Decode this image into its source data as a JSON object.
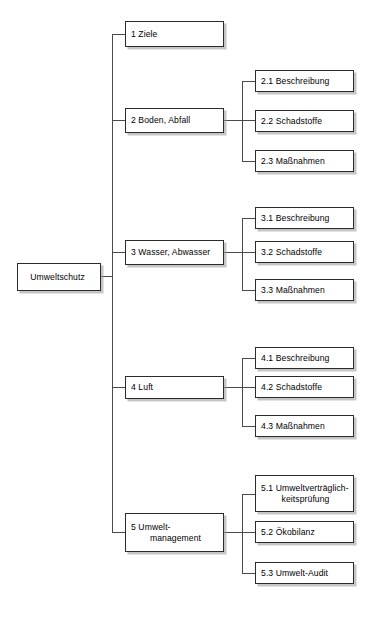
{
  "diagram": {
    "title": "Umweltschutz",
    "type": "organizational-tree",
    "root": {
      "label": "Umweltschutz"
    },
    "branches": [
      {
        "id": "1",
        "label": "1 Ziele",
        "children": []
      },
      {
        "id": "2",
        "label": "2 Boden, Abfall",
        "children": [
          {
            "id": "2.1",
            "label": "2.1 Beschreibung"
          },
          {
            "id": "2.2",
            "label": "2.2 Schadstoffe"
          },
          {
            "id": "2.3",
            "label": "2.3 Maßnahmen"
          }
        ]
      },
      {
        "id": "3",
        "label": "3 Wasser, Abwasser",
        "children": [
          {
            "id": "3.1",
            "label": "3.1 Beschreibung"
          },
          {
            "id": "3.2",
            "label": "3.2 Schadstoffe"
          },
          {
            "id": "3.3",
            "label": "3.3 Maßnahmen"
          }
        ]
      },
      {
        "id": "4",
        "label": "4 Luft",
        "children": [
          {
            "id": "4.1",
            "label": "4.1 Beschreibung"
          },
          {
            "id": "4.2",
            "label": "4.2 Schadstoffe"
          },
          {
            "id": "4.3",
            "label": "4.3 Maßnahmen"
          }
        ]
      },
      {
        "id": "5",
        "label_line1": "5 Umwelt-",
        "label_line2": "management",
        "children": [
          {
            "id": "5.1",
            "label_line1": "5.1 Umweltverträglich-",
            "label_line2": "keitsprüfung"
          },
          {
            "id": "5.2",
            "label": "5.2 Ökobilanz"
          },
          {
            "id": "5.3",
            "label": "5.3 Umwelt-Audit"
          }
        ]
      }
    ],
    "colors": {
      "box_border": "#2b2b2b",
      "box_fill": "#ffffff",
      "line": "#4a4a4a",
      "shadow": "#969696",
      "text": "#000000",
      "background": "#ffffff"
    }
  }
}
